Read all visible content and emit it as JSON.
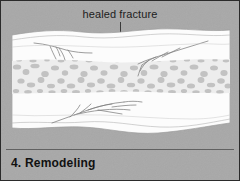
{
  "figure": {
    "background_color": "#a8a8a8",
    "border_color": "#2b2b2b",
    "annotation_label": "healed fracture",
    "caption": "4. Remodeling",
    "caption_number": "4.",
    "caption_title": "Remodeling"
  },
  "illustration": {
    "subject": "bone-cross-section-healed-fracture",
    "cortical_color": "#fbfbfb",
    "trabecular_band_color": "#c9c9c9",
    "outline_color": "#9a9a9a",
    "crack_color": "#6f6f6f",
    "leader_line_color": "#3a3a3a",
    "bands": [
      {
        "name": "upper-cortical-bone",
        "fill": "#fcfcfc"
      },
      {
        "name": "trabecular-spongy-bone",
        "fill": "#c9c9c9"
      },
      {
        "name": "lower-cortical-bone",
        "fill": "#fcfcfc"
      }
    ],
    "fracture_lines": [
      {
        "name": "upper-left-crack"
      },
      {
        "name": "upper-right-crack"
      },
      {
        "name": "lower-central-crack"
      }
    ]
  }
}
